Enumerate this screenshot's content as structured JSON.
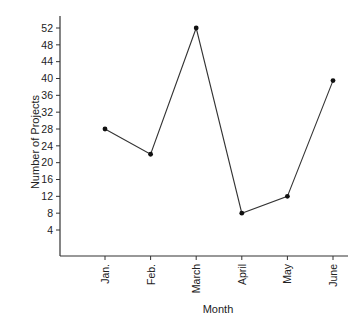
{
  "chart_data": {
    "type": "line",
    "title": "",
    "xlabel": "Month",
    "ylabel": "Number of Projects",
    "categories": [
      "Jan.",
      "Feb.",
      "March",
      "April",
      "May",
      "June"
    ],
    "series": [
      {
        "name": "Number of Projects",
        "values": [
          28,
          22,
          52,
          8,
          12,
          39.5
        ]
      }
    ],
    "yticks": [
      4,
      8,
      12,
      16,
      20,
      24,
      28,
      32,
      36,
      40,
      44,
      48,
      52
    ],
    "ylim": [
      0,
      55
    ],
    "grid": false,
    "legend": "none",
    "colors": {
      "line": "#333333",
      "marker": "#111111",
      "axis": "#333333"
    }
  }
}
